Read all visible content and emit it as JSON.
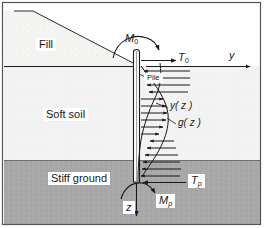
{
  "figure": {
    "border_color": "#555555",
    "background": "#ffffff"
  },
  "layers": [
    {
      "name": "fill",
      "label": "Fill",
      "color": "#f0efed",
      "texture": "stipple-light"
    },
    {
      "name": "soft-soil",
      "label": "Soft soil",
      "color": "#f2f2f2",
      "texture": "stipple-light"
    },
    {
      "name": "stiff-ground",
      "label": "Stiff ground",
      "color": "#a9a9a9",
      "texture": "stipple-dark"
    }
  ],
  "pile": {
    "label": "Pile",
    "fill": "#ffffff",
    "outline": "#1a1a1a"
  },
  "loads": {
    "moment_head": "M",
    "moment_head_sub": "0",
    "shear_head": "T",
    "shear_head_sub": "0",
    "moment_tip": "M",
    "moment_tip_sub": "p",
    "shear_tip": "T",
    "shear_tip_sub": "p"
  },
  "axes": {
    "horizontal": "y",
    "vertical": "z"
  },
  "curves": [
    {
      "name": "deflection",
      "label_main": "y",
      "label_arg": "( z )"
    },
    {
      "name": "soil-reaction",
      "label_main": "g",
      "label_arg": "( z )"
    }
  ],
  "pressure_arrows": {
    "direction_upper": "left",
    "direction_middle": "right",
    "direction_lower": "left",
    "color": "#1a1a1a"
  }
}
